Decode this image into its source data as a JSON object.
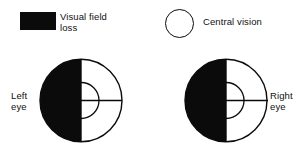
{
  "figure": {
    "background_color": "#ffffff",
    "ink_color": "#0b0b0b",
    "fill_color": "#0b0b0b",
    "blank_color": "#ffffff"
  },
  "legend": {
    "items": [
      {
        "swatch": "filled-rectangle",
        "swatch_color": "#0b0b0b",
        "label": "Visual field\nloss"
      },
      {
        "swatch": "open-circle",
        "swatch_color": "#ffffff",
        "label": "Central vision"
      }
    ]
  },
  "diagrams": [
    {
      "name": "left-eye",
      "label": "Left\neye",
      "label_side": "left",
      "shaded_half": "left",
      "clear_half": "right",
      "has_vertical_meridian": true,
      "has_horizontal_meridian": true,
      "has_central_vision_arc": true
    },
    {
      "name": "right-eye",
      "label": "Right\neye",
      "label_side": "right",
      "shaded_half": "left",
      "clear_half": "right",
      "has_vertical_meridian": true,
      "has_horizontal_meridian": true,
      "has_central_vision_arc": true
    }
  ]
}
